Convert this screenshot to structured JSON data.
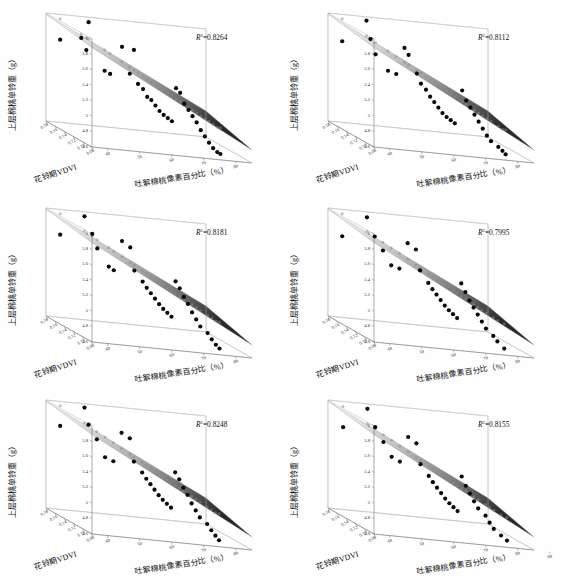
{
  "figure": {
    "title": "",
    "panel_count": 6,
    "layout": "2 columns x 3 rows",
    "background_color": "#ffffff"
  },
  "axes": {
    "z_label": "上层棉桃单铃重（g）",
    "x_label": "花铃期VDVI",
    "y_label": "吐絮棉桃像素百分比（%）",
    "z_ticks": [
      "4.6",
      "4.8",
      "5",
      "5.2",
      "5.4",
      "5.6",
      "5.8",
      "6"
    ],
    "x_ticks": [
      "0.18",
      "0.16",
      "0.14",
      "0.12",
      "0.10",
      "0.08"
    ],
    "y_ticks": [
      "40",
      "50",
      "60",
      "70",
      "80"
    ],
    "y_ticks_extended": [
      "40",
      "50",
      "60",
      "70",
      "80",
      "90"
    ],
    "z_range": [
      4.6,
      6.0
    ],
    "x_range": [
      0.08,
      0.18
    ],
    "y_range": [
      35,
      85
    ]
  },
  "chart_data": {
    "type": "scatter",
    "title": "",
    "xlabel": "花铃期VDVI",
    "ylabel": "吐絮棉桃像素百分比（%）",
    "zlabel": "上层棉桃单铃重（g）",
    "xlim": [
      0.08,
      0.18
    ],
    "ylim": [
      35,
      85
    ],
    "zlim": [
      4.6,
      6.0
    ],
    "grid": false,
    "legend": "none",
    "surface": "fitted regression plane with grayscale gradient, light at low-percentage / high-VDVI corner, dark at high-percentage / low-VDVI corner",
    "panels": [
      {
        "index": 0,
        "position": "top-left",
        "r2_label": "R",
        "r2_exponent": "2",
        "r2_value": "=0.8264",
        "r2_numeric": 0.8264,
        "y_ticks": [
          "40",
          "50",
          "60",
          "70",
          "80"
        ],
        "points": [
          {
            "x": 0.17,
            "y": 38,
            "z": 5.7
          },
          {
            "x": 0.15,
            "y": 44,
            "z": 6.02
          },
          {
            "x": 0.152,
            "y": 42,
            "z": 5.8
          },
          {
            "x": 0.148,
            "y": 43,
            "z": 5.66
          },
          {
            "x": 0.143,
            "y": 48,
            "z": 5.43
          },
          {
            "x": 0.138,
            "y": 49,
            "z": 5.41
          },
          {
            "x": 0.133,
            "y": 52,
            "z": 5.79
          },
          {
            "x": 0.128,
            "y": 55,
            "z": 5.78
          },
          {
            "x": 0.13,
            "y": 54,
            "z": 5.46
          },
          {
            "x": 0.126,
            "y": 56,
            "z": 5.35
          },
          {
            "x": 0.122,
            "y": 57,
            "z": 5.3
          },
          {
            "x": 0.12,
            "y": 58,
            "z": 5.21
          },
          {
            "x": 0.118,
            "y": 59,
            "z": 5.18
          },
          {
            "x": 0.116,
            "y": 60,
            "z": 5.12
          },
          {
            "x": 0.114,
            "y": 61,
            "z": 5.06
          },
          {
            "x": 0.112,
            "y": 62,
            "z": 5.02
          },
          {
            "x": 0.11,
            "y": 63,
            "z": 4.99
          },
          {
            "x": 0.108,
            "y": 64,
            "z": 4.96
          },
          {
            "x": 0.106,
            "y": 65,
            "z": 5.4
          },
          {
            "x": 0.104,
            "y": 66,
            "z": 5.35
          },
          {
            "x": 0.102,
            "y": 67,
            "z": 5.22
          },
          {
            "x": 0.1,
            "y": 68,
            "z": 5.15
          },
          {
            "x": 0.098,
            "y": 69,
            "z": 5.08
          },
          {
            "x": 0.096,
            "y": 70,
            "z": 5.01
          },
          {
            "x": 0.094,
            "y": 71,
            "z": 4.92
          },
          {
            "x": 0.092,
            "y": 72,
            "z": 4.85
          },
          {
            "x": 0.09,
            "y": 73,
            "z": 4.78
          },
          {
            "x": 0.088,
            "y": 74,
            "z": 4.72
          },
          {
            "x": 0.086,
            "y": 75,
            "z": 4.68
          },
          {
            "x": 0.1,
            "y": 78,
            "z": 4.62
          }
        ]
      },
      {
        "index": 1,
        "position": "top-right",
        "r2_label": "R",
        "r2_exponent": "2",
        "r2_value": "=0.8112",
        "r2_numeric": 0.8112,
        "y_ticks": [
          "40",
          "50",
          "60",
          "70",
          "80"
        ],
        "points": [
          {
            "x": 0.17,
            "y": 38,
            "z": 5.68
          },
          {
            "x": 0.152,
            "y": 43,
            "z": 6.03
          },
          {
            "x": 0.15,
            "y": 44,
            "z": 5.8
          },
          {
            "x": 0.146,
            "y": 45,
            "z": 5.62
          },
          {
            "x": 0.14,
            "y": 48,
            "z": 5.44
          },
          {
            "x": 0.136,
            "y": 50,
            "z": 5.42
          },
          {
            "x": 0.132,
            "y": 52,
            "z": 5.78
          },
          {
            "x": 0.13,
            "y": 53,
            "z": 5.7
          },
          {
            "x": 0.126,
            "y": 55,
            "z": 5.48
          },
          {
            "x": 0.124,
            "y": 56,
            "z": 5.36
          },
          {
            "x": 0.12,
            "y": 57,
            "z": 5.3
          },
          {
            "x": 0.118,
            "y": 58,
            "z": 5.22
          },
          {
            "x": 0.116,
            "y": 59,
            "z": 5.16
          },
          {
            "x": 0.114,
            "y": 60,
            "z": 5.1
          },
          {
            "x": 0.112,
            "y": 61,
            "z": 5.04
          },
          {
            "x": 0.11,
            "y": 62,
            "z": 5.0
          },
          {
            "x": 0.108,
            "y": 63,
            "z": 4.97
          },
          {
            "x": 0.106,
            "y": 64,
            "z": 4.94
          },
          {
            "x": 0.104,
            "y": 66,
            "z": 5.38
          },
          {
            "x": 0.102,
            "y": 67,
            "z": 5.26
          },
          {
            "x": 0.1,
            "y": 68,
            "z": 5.18
          },
          {
            "x": 0.098,
            "y": 69,
            "z": 5.1
          },
          {
            "x": 0.096,
            "y": 70,
            "z": 5.02
          },
          {
            "x": 0.094,
            "y": 71,
            "z": 4.94
          },
          {
            "x": 0.092,
            "y": 72,
            "z": 4.86
          },
          {
            "x": 0.09,
            "y": 73,
            "z": 4.8
          },
          {
            "x": 0.088,
            "y": 75,
            "z": 4.74
          },
          {
            "x": 0.086,
            "y": 76,
            "z": 4.7
          },
          {
            "x": 0.1,
            "y": 79,
            "z": 4.62
          }
        ]
      },
      {
        "index": 2,
        "position": "middle-left",
        "r2_label": "R",
        "r2_exponent": "2",
        "r2_value": "=0.8181",
        "r2_numeric": 0.8181,
        "y_ticks": [
          "40",
          "50",
          "60",
          "70",
          "80"
        ],
        "points": [
          {
            "x": 0.17,
            "y": 38,
            "z": 5.7
          },
          {
            "x": 0.152,
            "y": 43,
            "z": 6.02
          },
          {
            "x": 0.149,
            "y": 45,
            "z": 5.81
          },
          {
            "x": 0.145,
            "y": 46,
            "z": 5.64
          },
          {
            "x": 0.141,
            "y": 49,
            "z": 5.43
          },
          {
            "x": 0.137,
            "y": 50,
            "z": 5.4
          },
          {
            "x": 0.133,
            "y": 52,
            "z": 5.8
          },
          {
            "x": 0.129,
            "y": 54,
            "z": 5.74
          },
          {
            "x": 0.127,
            "y": 55,
            "z": 5.45
          },
          {
            "x": 0.123,
            "y": 57,
            "z": 5.33
          },
          {
            "x": 0.121,
            "y": 58,
            "z": 5.26
          },
          {
            "x": 0.119,
            "y": 59,
            "z": 5.2
          },
          {
            "x": 0.117,
            "y": 60,
            "z": 5.14
          },
          {
            "x": 0.115,
            "y": 61,
            "z": 5.08
          },
          {
            "x": 0.113,
            "y": 62,
            "z": 5.03
          },
          {
            "x": 0.111,
            "y": 63,
            "z": 4.99
          },
          {
            "x": 0.109,
            "y": 64,
            "z": 4.95
          },
          {
            "x": 0.107,
            "y": 65,
            "z": 5.42
          },
          {
            "x": 0.105,
            "y": 66,
            "z": 5.34
          },
          {
            "x": 0.103,
            "y": 67,
            "z": 5.24
          },
          {
            "x": 0.101,
            "y": 68,
            "z": 5.16
          },
          {
            "x": 0.099,
            "y": 69,
            "z": 5.06
          },
          {
            "x": 0.097,
            "y": 70,
            "z": 4.98
          },
          {
            "x": 0.095,
            "y": 71,
            "z": 4.9
          },
          {
            "x": 0.093,
            "y": 73,
            "z": 4.83
          },
          {
            "x": 0.091,
            "y": 74,
            "z": 4.76
          },
          {
            "x": 0.089,
            "y": 75,
            "z": 4.7
          },
          {
            "x": 0.102,
            "y": 78,
            "z": 4.62
          }
        ]
      },
      {
        "index": 3,
        "position": "middle-right",
        "r2_label": "R",
        "r2_exponent": "2",
        "r2_value": "=0.7995",
        "r2_numeric": 0.7995,
        "y_ticks": [
          "40",
          "50",
          "60",
          "70",
          "80"
        ],
        "points": [
          {
            "x": 0.17,
            "y": 38,
            "z": 5.68
          },
          {
            "x": 0.151,
            "y": 43,
            "z": 6.01
          },
          {
            "x": 0.148,
            "y": 45,
            "z": 5.78
          },
          {
            "x": 0.144,
            "y": 47,
            "z": 5.62
          },
          {
            "x": 0.14,
            "y": 49,
            "z": 5.45
          },
          {
            "x": 0.136,
            "y": 51,
            "z": 5.43
          },
          {
            "x": 0.132,
            "y": 53,
            "z": 5.78
          },
          {
            "x": 0.128,
            "y": 55,
            "z": 5.72
          },
          {
            "x": 0.126,
            "y": 56,
            "z": 5.46
          },
          {
            "x": 0.122,
            "y": 58,
            "z": 5.32
          },
          {
            "x": 0.12,
            "y": 59,
            "z": 5.25
          },
          {
            "x": 0.118,
            "y": 60,
            "z": 5.19
          },
          {
            "x": 0.116,
            "y": 61,
            "z": 5.13
          },
          {
            "x": 0.114,
            "y": 62,
            "z": 5.07
          },
          {
            "x": 0.112,
            "y": 63,
            "z": 5.02
          },
          {
            "x": 0.11,
            "y": 64,
            "z": 4.98
          },
          {
            "x": 0.108,
            "y": 65,
            "z": 4.94
          },
          {
            "x": 0.106,
            "y": 66,
            "z": 5.4
          },
          {
            "x": 0.104,
            "y": 67,
            "z": 5.3
          },
          {
            "x": 0.102,
            "y": 68,
            "z": 5.2
          },
          {
            "x": 0.1,
            "y": 69,
            "z": 5.12
          },
          {
            "x": 0.098,
            "y": 70,
            "z": 5.04
          },
          {
            "x": 0.096,
            "y": 71,
            "z": 4.96
          },
          {
            "x": 0.094,
            "y": 72,
            "z": 4.88
          },
          {
            "x": 0.092,
            "y": 74,
            "z": 4.8
          },
          {
            "x": 0.09,
            "y": 75,
            "z": 4.74
          },
          {
            "x": 0.103,
            "y": 79,
            "z": 4.62
          }
        ]
      },
      {
        "index": 4,
        "position": "bottom-left",
        "r2_label": "R",
        "r2_exponent": "2",
        "r2_value": "=0.8248",
        "r2_numeric": 0.8248,
        "y_ticks": [
          "40",
          "50",
          "60",
          "70",
          "80"
        ],
        "points": [
          {
            "x": 0.17,
            "y": 38,
            "z": 5.71
          },
          {
            "x": 0.152,
            "y": 43,
            "z": 6.03
          },
          {
            "x": 0.15,
            "y": 44,
            "z": 5.82
          },
          {
            "x": 0.146,
            "y": 46,
            "z": 5.65
          },
          {
            "x": 0.142,
            "y": 48,
            "z": 5.44
          },
          {
            "x": 0.138,
            "y": 50,
            "z": 5.41
          },
          {
            "x": 0.134,
            "y": 52,
            "z": 5.8
          },
          {
            "x": 0.13,
            "y": 54,
            "z": 5.75
          },
          {
            "x": 0.128,
            "y": 55,
            "z": 5.46
          },
          {
            "x": 0.124,
            "y": 57,
            "z": 5.34
          },
          {
            "x": 0.122,
            "y": 58,
            "z": 5.27
          },
          {
            "x": 0.12,
            "y": 59,
            "z": 5.21
          },
          {
            "x": 0.118,
            "y": 60,
            "z": 5.15
          },
          {
            "x": 0.116,
            "y": 61,
            "z": 5.09
          },
          {
            "x": 0.114,
            "y": 62,
            "z": 5.04
          },
          {
            "x": 0.112,
            "y": 63,
            "z": 5.0
          },
          {
            "x": 0.11,
            "y": 64,
            "z": 4.96
          },
          {
            "x": 0.108,
            "y": 65,
            "z": 5.43
          },
          {
            "x": 0.106,
            "y": 66,
            "z": 5.35
          },
          {
            "x": 0.104,
            "y": 67,
            "z": 5.25
          },
          {
            "x": 0.102,
            "y": 68,
            "z": 5.17
          },
          {
            "x": 0.1,
            "y": 69,
            "z": 5.07
          },
          {
            "x": 0.098,
            "y": 70,
            "z": 4.99
          },
          {
            "x": 0.096,
            "y": 71,
            "z": 4.91
          },
          {
            "x": 0.094,
            "y": 73,
            "z": 4.84
          },
          {
            "x": 0.092,
            "y": 74,
            "z": 4.77
          },
          {
            "x": 0.09,
            "y": 75,
            "z": 4.71
          },
          {
            "x": 0.103,
            "y": 78,
            "z": 4.62
          }
        ]
      },
      {
        "index": 5,
        "position": "bottom-right",
        "r2_label": "R",
        "r2_exponent": "2",
        "r2_value": "=0.8155",
        "r2_numeric": 0.8155,
        "y_ticks": [
          "40",
          "50",
          "60",
          "70",
          "80",
          "90"
        ],
        "points": [
          {
            "x": 0.168,
            "y": 38,
            "z": 5.7
          },
          {
            "x": 0.15,
            "y": 43,
            "z": 6.02
          },
          {
            "x": 0.147,
            "y": 45,
            "z": 5.8
          },
          {
            "x": 0.143,
            "y": 47,
            "z": 5.63
          },
          {
            "x": 0.139,
            "y": 49,
            "z": 5.46
          },
          {
            "x": 0.135,
            "y": 51,
            "z": 5.42
          },
          {
            "x": 0.131,
            "y": 53,
            "z": 5.76
          },
          {
            "x": 0.127,
            "y": 55,
            "z": 5.7
          },
          {
            "x": 0.125,
            "y": 56,
            "z": 5.44
          },
          {
            "x": 0.121,
            "y": 58,
            "z": 5.31
          },
          {
            "x": 0.119,
            "y": 59,
            "z": 5.24
          },
          {
            "x": 0.117,
            "y": 60,
            "z": 5.18
          },
          {
            "x": 0.115,
            "y": 61,
            "z": 5.12
          },
          {
            "x": 0.113,
            "y": 62,
            "z": 5.06
          },
          {
            "x": 0.111,
            "y": 63,
            "z": 5.01
          },
          {
            "x": 0.109,
            "y": 64,
            "z": 4.97
          },
          {
            "x": 0.107,
            "y": 65,
            "z": 4.93
          },
          {
            "x": 0.105,
            "y": 66,
            "z": 5.39
          },
          {
            "x": 0.103,
            "y": 67,
            "z": 5.28
          },
          {
            "x": 0.101,
            "y": 68,
            "z": 5.19
          },
          {
            "x": 0.099,
            "y": 69,
            "z": 5.1
          },
          {
            "x": 0.097,
            "y": 70,
            "z": 5.02
          },
          {
            "x": 0.095,
            "y": 72,
            "z": 4.94
          },
          {
            "x": 0.093,
            "y": 73,
            "z": 4.86
          },
          {
            "x": 0.091,
            "y": 74,
            "z": 4.79
          },
          {
            "x": 0.089,
            "y": 76,
            "z": 4.72
          },
          {
            "x": 0.104,
            "y": 80,
            "z": 4.62
          }
        ]
      }
    ]
  }
}
